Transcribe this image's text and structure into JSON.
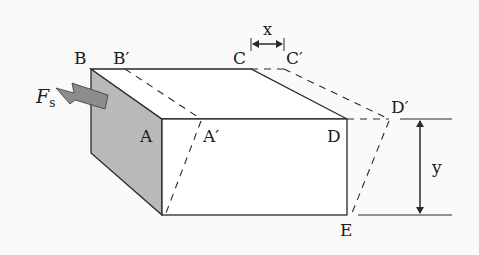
{
  "diagram": {
    "labels": {
      "B": "B",
      "B_prime": "B′",
      "C": "C",
      "C_prime": "C′",
      "A": "A",
      "A_prime": "A′",
      "D": "D",
      "D_prime": "D′",
      "E": "E",
      "x": "x",
      "y": "y",
      "force_main": "F",
      "force_sub": "s"
    },
    "colors": {
      "line": "#2a2a2a",
      "shaded_face": "#b9b9b9",
      "arrow_fill": "#8c8c8c",
      "background": "#fafafa"
    }
  }
}
